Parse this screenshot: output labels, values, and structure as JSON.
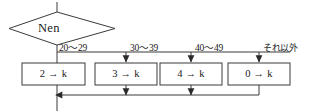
{
  "diagram": {
    "type": "flowchart",
    "title_text": "",
    "decision": {
      "label": "Nen",
      "shape": "diamond"
    },
    "branches": [
      {
        "label": "20～29",
        "result": "2 → k"
      },
      {
        "label": "30～39",
        "result": "3 → k"
      },
      {
        "label": "40～49",
        "result": "4 → k"
      },
      {
        "label": "それ以外",
        "result": "0 → k"
      }
    ],
    "colors": {
      "stroke": "#3a3a3a",
      "text": "#1a1a1a",
      "background": "#ffffff"
    }
  }
}
